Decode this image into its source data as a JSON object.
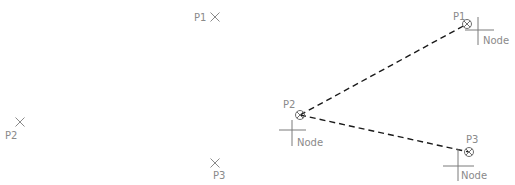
{
  "left_panel": {
    "points": [
      {
        "id": "P1",
        "label": "P1",
        "marker": "x-mark-icon",
        "x": 215,
        "y": 17,
        "label_x": 194,
        "label_y": 21
      },
      {
        "id": "P2",
        "label": "P2",
        "marker": "x-mark-icon",
        "x": 20,
        "y": 122,
        "label_x": 5,
        "label_y": 139
      },
      {
        "id": "P3",
        "label": "P3",
        "marker": "x-mark-icon",
        "x": 215,
        "y": 163,
        "label_x": 213,
        "label_y": 179
      }
    ]
  },
  "right_panel": {
    "points": [
      {
        "id": "P1",
        "label": "P1",
        "node_label": "Node",
        "x": 467,
        "y": 24,
        "label_x": 453,
        "label_y": 20,
        "cross_x": 478,
        "cross_y": 30,
        "cross_h": [
          465,
          494
        ],
        "cross_v": [
          17,
          45
        ],
        "node_x": 483,
        "node_y": 44
      },
      {
        "id": "P2",
        "label": "P2",
        "node_label": "Node",
        "x": 300,
        "y": 115,
        "label_x": 283,
        "label_y": 108,
        "cross_x": 292,
        "cross_y": 130,
        "cross_h": [
          279,
          306
        ],
        "cross_v": [
          120,
          146
        ],
        "node_x": 297,
        "node_y": 146
      },
      {
        "id": "P3",
        "label": "P3",
        "node_label": "Node",
        "x": 469,
        "y": 152,
        "label_x": 466,
        "label_y": 143,
        "cross_x": 458,
        "cross_y": 166,
        "cross_h": [
          443,
          474
        ],
        "cross_v": [
          149,
          181
        ],
        "node_x": 461,
        "node_y": 179
      }
    ],
    "connections": [
      {
        "from": "P2",
        "to": "P1",
        "style": "dashed"
      },
      {
        "from": "P2",
        "to": "P3",
        "style": "dashed"
      }
    ]
  },
  "colors": {
    "background": "#ffffff",
    "marker": "#8a8a8a",
    "dashed_line": "#1a1a1a"
  }
}
